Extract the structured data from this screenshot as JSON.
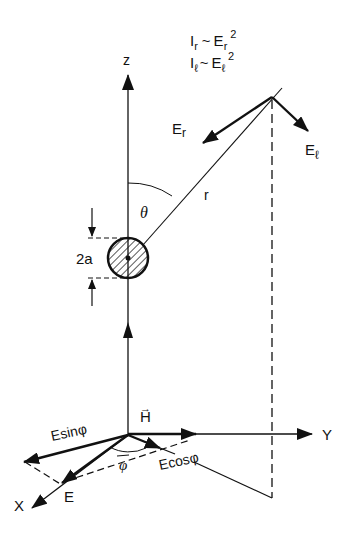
{
  "diagram": {
    "colors": {
      "ink": "#111111",
      "background": "#ffffff"
    },
    "relations": {
      "line1": {
        "lhs": "I",
        "lhs_sub": "r",
        "op": "~",
        "rhs": "E",
        "rhs_sub": "r",
        "rhs_sup": "2"
      },
      "line2": {
        "lhs": "I",
        "lhs_sub": "ℓ",
        "op": "~",
        "rhs": "E",
        "rhs_sub": "ℓ",
        "rhs_sup": "2"
      }
    },
    "axes": {
      "z": "z",
      "y": "Y",
      "x": "X"
    },
    "labels": {
      "E_r": {
        "base": "E",
        "sub": "r"
      },
      "E_l": {
        "base": "E",
        "sub": "ℓ"
      },
      "r": "r",
      "theta": "θ",
      "diameter": "2a",
      "H": "H",
      "H_vec": "→",
      "E": "E",
      "Esin": "Esinφ",
      "Ecos": "Ecosφ",
      "phi": "φ"
    }
  }
}
